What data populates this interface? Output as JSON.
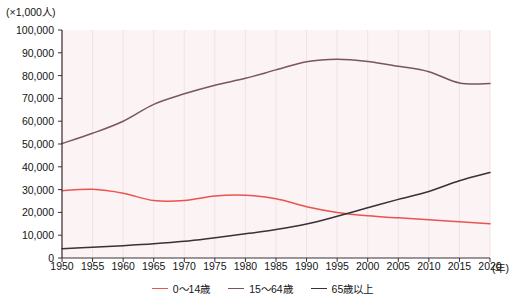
{
  "chart_data": {
    "type": "line",
    "title": "",
    "subtitle": "",
    "xlabel": "年",
    "ylabel": "×1,000人",
    "unit_label": "(×1,000人)",
    "x_axis_unit": "(年)",
    "grid": true,
    "legend_position": "bottom-center",
    "xlim": [
      1950,
      2020
    ],
    "ylim": [
      0,
      100000
    ],
    "y_ticks": [
      0,
      10000,
      20000,
      30000,
      40000,
      50000,
      60000,
      70000,
      80000,
      90000,
      100000
    ],
    "y_tick_labels": [
      "0",
      "10,000",
      "20,000",
      "30,000",
      "40,000",
      "50,000",
      "60,000",
      "70,000",
      "80,000",
      "90,000",
      "100,000"
    ],
    "x": [
      1950,
      1955,
      1960,
      1965,
      1970,
      1975,
      1980,
      1985,
      1990,
      1995,
      2000,
      2005,
      2010,
      2015,
      2020
    ],
    "x_tick_labels": [
      "1950",
      "1955",
      "1960",
      "1965",
      "1970",
      "1975",
      "1980",
      "1985",
      "1990",
      "1995",
      "2000",
      "2005",
      "2010",
      "2015",
      "2020"
    ],
    "series": [
      {
        "name": "0～14歳",
        "color": "#e8544f",
        "values": [
          29500,
          30100,
          28400,
          25200,
          25200,
          27200,
          27500,
          26000,
          22500,
          20000,
          18500,
          17600,
          16800,
          15900,
          15000
        ]
      },
      {
        "name": "15～64歳",
        "color": "#7a5560",
        "values": [
          50200,
          54700,
          60000,
          67400,
          72000,
          75800,
          78800,
          82500,
          86100,
          87200,
          86200,
          84100,
          81700,
          76800,
          76500
        ]
      },
      {
        "name": "65歳以上",
        "color": "#3a3035",
        "values": [
          4100,
          4750,
          5400,
          6200,
          7300,
          8900,
          10600,
          12500,
          14900,
          18300,
          22000,
          25700,
          29200,
          33900,
          37500
        ]
      }
    ]
  },
  "legend": {
    "items": [
      {
        "label": "0～14歳",
        "color": "#e8544f"
      },
      {
        "label": "15～64歳",
        "color": "#7a5560"
      },
      {
        "label": "65歳以上",
        "color": "#3a3035"
      }
    ]
  },
  "colors": {
    "plot_background": "#fbf3f4",
    "axis": "#3a3035",
    "gridline": "#f2e3e5",
    "text": "#141414"
  }
}
